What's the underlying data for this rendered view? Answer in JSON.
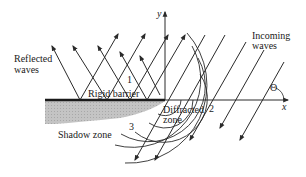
{
  "diagram": {
    "type": "wave diffraction at edge of rigid barrier",
    "labels": {
      "reflected_line1": "Reflected",
      "reflected_line2": "waves",
      "incoming_line1": "Incoming",
      "incoming_line2": "waves",
      "barrier": "Rigid barrier",
      "diffracted_line1": "Diffracted",
      "diffracted_line2": "zone",
      "shadow": "Shadow zone",
      "region1": "1",
      "region2": "2",
      "region3": "3",
      "y_axis": "y",
      "x_axis": "x",
      "angle": "Θ"
    },
    "colors": {
      "line": "#2a2a2a",
      "barrier": "#1a1a1a",
      "shadow": "#b8b8b8",
      "background": "#ffffff"
    }
  }
}
